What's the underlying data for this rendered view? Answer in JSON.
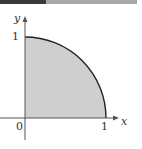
{
  "diagram": {
    "axes": {
      "x_label": "x",
      "y_label": "y",
      "origin_label": "0",
      "x_tick_label": "1",
      "y_tick_label": "1"
    },
    "region": {
      "shape": "quarter-circle",
      "radius": 1,
      "fill_color": "#cfcfcf",
      "stroke_color": "#222222"
    },
    "topbar": {
      "dark_color": "#3a3a3a",
      "light_color": "#a8a8a8"
    }
  }
}
